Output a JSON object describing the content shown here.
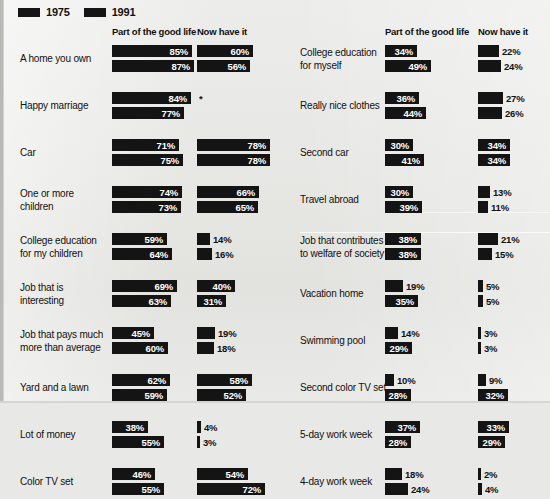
{
  "legend": {
    "items": [
      {
        "label": "1975",
        "color": "#151515",
        "icon": "legend-swatch-icon"
      },
      {
        "label": "1991",
        "color": "#151515",
        "icon": "legend-swatch-icon"
      }
    ]
  },
  "columns": {
    "good_life": "Part of the good life",
    "have_it": "Now have it"
  },
  "footnote_marker": "*",
  "chart_data": {
    "type": "bar",
    "title": "",
    "subtitle": "",
    "xlabel": "",
    "ylabel": "",
    "xlim": [
      0,
      100
    ],
    "grid": false,
    "legend_position": "top-left",
    "units": "percent",
    "series": [
      {
        "name": "1975",
        "color": "#151515"
      },
      {
        "name": "1991",
        "color": "#151515"
      }
    ],
    "measures": [
      "Part of the good life",
      "Now have it"
    ],
    "panels": [
      {
        "name": "left",
        "categories": [
          {
            "label": "A home you own",
            "good_life": {
              "1975": 85,
              "1991": 87
            },
            "have_it": {
              "1975": 60,
              "1991": 56
            }
          },
          {
            "label": "Happy marriage",
            "good_life": {
              "1975": 84,
              "1991": 77
            },
            "have_it": {
              "1975": null,
              "1991": null
            }
          },
          {
            "label": "Car",
            "good_life": {
              "1975": 71,
              "1991": 75
            },
            "have_it": {
              "1975": 78,
              "1991": 78
            }
          },
          {
            "label": "One or more\nchildren",
            "good_life": {
              "1975": 74,
              "1991": 73
            },
            "have_it": {
              "1975": 66,
              "1991": 65
            }
          },
          {
            "label": "College education\nfor my children",
            "good_life": {
              "1975": 59,
              "1991": 64
            },
            "have_it": {
              "1975": 14,
              "1991": 16
            }
          },
          {
            "label": "Job that is\ninteresting",
            "good_life": {
              "1975": 69,
              "1991": 63
            },
            "have_it": {
              "1975": 40,
              "1991": 31
            }
          },
          {
            "label": "Job that pays much\nmore than average",
            "good_life": {
              "1975": 45,
              "1991": 60
            },
            "have_it": {
              "1975": 19,
              "1991": 18
            }
          },
          {
            "label": "Yard and a lawn",
            "good_life": {
              "1975": 62,
              "1991": 59
            },
            "have_it": {
              "1975": 58,
              "1991": 52
            }
          },
          {
            "label": "Lot of money",
            "good_life": {
              "1975": 38,
              "1991": 55
            },
            "have_it": {
              "1975": 4,
              "1991": 3
            }
          },
          {
            "label": "Color TV set",
            "good_life": {
              "1975": 46,
              "1991": 55
            },
            "have_it": {
              "1975": 54,
              "1991": 72
            }
          }
        ]
      },
      {
        "name": "right",
        "categories": [
          {
            "label": "College education\nfor myself",
            "good_life": {
              "1975": 34,
              "1991": 49
            },
            "have_it": {
              "1975": 22,
              "1991": 24
            }
          },
          {
            "label": "Really nice clothes",
            "good_life": {
              "1975": 36,
              "1991": 44
            },
            "have_it": {
              "1975": 27,
              "1991": 26
            }
          },
          {
            "label": "Second car",
            "good_life": {
              "1975": 30,
              "1991": 41
            },
            "have_it": {
              "1975": 34,
              "1991": 34
            }
          },
          {
            "label": "Travel abroad",
            "good_life": {
              "1975": 30,
              "1991": 39
            },
            "have_it": {
              "1975": 13,
              "1991": 11
            }
          },
          {
            "label": "Job that contributes\nto welfare of society",
            "good_life": {
              "1975": 38,
              "1991": 38
            },
            "have_it": {
              "1975": 21,
              "1991": 15
            }
          },
          {
            "label": "Vacation home",
            "good_life": {
              "1975": 19,
              "1991": 35
            },
            "have_it": {
              "1975": 5,
              "1991": 5
            }
          },
          {
            "label": "Swimming pool",
            "good_life": {
              "1975": 14,
              "1991": 29
            },
            "have_it": {
              "1975": 3,
              "1991": 3
            }
          },
          {
            "label": "Second color TV set",
            "good_life": {
              "1975": 10,
              "1991": 28
            },
            "have_it": {
              "1975": 9,
              "1991": 32
            }
          },
          {
            "label": "5-day work week",
            "good_life": {
              "1975": 37,
              "1991": 28
            },
            "have_it": {
              "1975": 33,
              "1991": 29
            }
          },
          {
            "label": "4-day work week",
            "good_life": {
              "1975": 18,
              "1991": 24
            },
            "have_it": {
              "1975": 2,
              "1991": 4
            }
          }
        ]
      }
    ]
  }
}
